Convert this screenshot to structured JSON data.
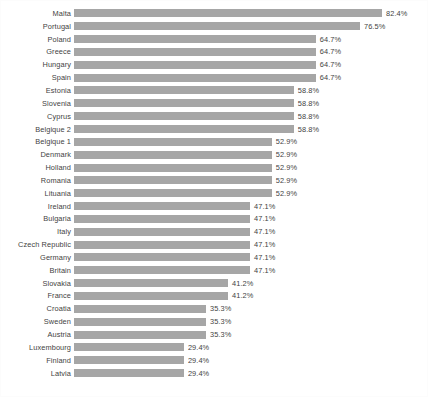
{
  "chart_data": {
    "type": "bar",
    "orientation": "horizontal",
    "title": "",
    "subtitle": "",
    "xlabel": "",
    "ylabel": "",
    "xlim": [
      0,
      82.4
    ],
    "grid": false,
    "legend": "none",
    "value_suffix": "%",
    "bar_color": "#a6a6a6",
    "label_color": "#3f3f3f",
    "background_color": "#ffffff",
    "max_value": 82.4,
    "categories": [
      "Malta",
      "Portugal",
      "Poland",
      "Greece",
      "Hungary",
      "Spain",
      "Estonia",
      "Slovenia",
      "Cyprus",
      "Belgique 2",
      "Belgique 1",
      "Denmark",
      "Holland",
      "Romania",
      "Lituania",
      "Ireland",
      "Bulgaria",
      "Italy",
      "Czech Republic",
      "Germany",
      "Britain",
      "Slovakia",
      "France",
      "Croatia",
      "Sweden",
      "Austria",
      "Luxembourg",
      "Finland",
      "Latvia"
    ],
    "values": [
      82.4,
      76.5,
      64.7,
      64.7,
      64.7,
      64.7,
      58.8,
      58.8,
      58.8,
      58.8,
      52.9,
      52.9,
      52.9,
      52.9,
      52.9,
      47.1,
      47.1,
      47.1,
      47.1,
      47.1,
      47.1,
      41.2,
      41.2,
      35.3,
      35.3,
      35.3,
      29.4,
      29.4,
      29.4
    ],
    "data_labels": [
      "82.4%",
      "76.5%",
      "64.7%",
      "64.7%",
      "64.7%",
      "64.7%",
      "58.8%",
      "58.8%",
      "58.8%",
      "58.8%",
      "52.9%",
      "52.9%",
      "52.9%",
      "52.9%",
      "52.9%",
      "47.1%",
      "47.1%",
      "47.1%",
      "47.1%",
      "47.1%",
      "47.1%",
      "41.2%",
      "41.2%",
      "35.3%",
      "35.3%",
      "35.3%",
      "29.4%",
      "29.4%",
      "29.4%"
    ]
  }
}
